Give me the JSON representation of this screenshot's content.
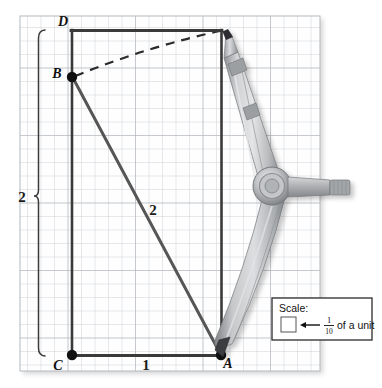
{
  "figure": {
    "type": "geometry-construction-diagram",
    "background_color": "#ffffff",
    "grid": {
      "cell_size_px": 13.5,
      "line_color": "#c8cdd2",
      "major_line_color": "#9aa2aa",
      "paper_color": "#fefefe",
      "x0": 20,
      "y0": 16,
      "cols": 22,
      "rows": 26
    },
    "points": [
      {
        "id": "A",
        "label": "A",
        "x": 221,
        "y": 355,
        "label_x": 228,
        "label_y": 368,
        "dot": true
      },
      {
        "id": "B",
        "label": "B",
        "x": 72,
        "y": 77,
        "label_x": 57,
        "label_y": 78,
        "dot": true
      },
      {
        "id": "C",
        "label": "C",
        "x": 72,
        "y": 355,
        "label_x": 58,
        "label_y": 370,
        "dot": true
      },
      {
        "id": "D",
        "label": "D",
        "x": 221,
        "y": 30,
        "label_x": 63,
        "label_y": 26,
        "dot": false
      }
    ],
    "segments": [
      {
        "name": "segment-CA",
        "from": "C",
        "to": "A",
        "color": "#3a3a3a",
        "width": 2.6
      },
      {
        "name": "segment-CD-vertical",
        "from": "C",
        "to": "D-top-left",
        "color": "#3a3a3a",
        "width": 2.6
      },
      {
        "name": "segment-DE-top",
        "from": "D-top-left",
        "to": "D",
        "color": "#3a3a3a",
        "width": 2.6
      },
      {
        "name": "segment-DA-right",
        "from": "D",
        "to": "A",
        "color": "#3a3a3a",
        "width": 2.6
      },
      {
        "name": "segment-BA-diagonal",
        "from": "B",
        "to": "A",
        "color": "#5a5a5a",
        "width": 3.0
      }
    ],
    "arc": {
      "name": "dashed-arc-B-to-D",
      "from": "B",
      "to": "D",
      "style": "dashed",
      "color": "#2b2b2b",
      "width": 2.2,
      "dash_pattern": "9 7"
    },
    "measure_labels": [
      {
        "name": "label-height-2",
        "text": "2",
        "x": 22,
        "y": 200,
        "bold": true
      },
      {
        "name": "label-diagonal-2",
        "text": "2",
        "x": 152,
        "y": 212,
        "bold": true
      },
      {
        "name": "label-base-1",
        "text": "1",
        "x": 145,
        "y": 368,
        "bold": true
      }
    ],
    "brace": {
      "name": "left-height-brace",
      "x": 39,
      "y_top": 30,
      "y_bottom": 356,
      "color": "#3a3a3a",
      "tick_y": 196
    },
    "compass": {
      "name": "compass-tool",
      "pivot_x": 272,
      "pivot_y": 186,
      "pencil_tip_x": 223,
      "pencil_tip_y": 31,
      "needle_tip_x": 222,
      "needle_tip_y": 356,
      "body_color": "#b4b6b8",
      "highlight_color": "#dcdee0",
      "shadow_color": "#8e9194",
      "handle_color": "#b0b2b4"
    },
    "scale_legend": {
      "name": "scale-legend-box",
      "x": 272,
      "y": 298,
      "width": 100,
      "height": 42,
      "title": "Scale:",
      "numerator": "1",
      "denominator": "10",
      "unit_text": "of a unit",
      "border_color": "#2b2b2b",
      "background": "#ffffff"
    }
  }
}
